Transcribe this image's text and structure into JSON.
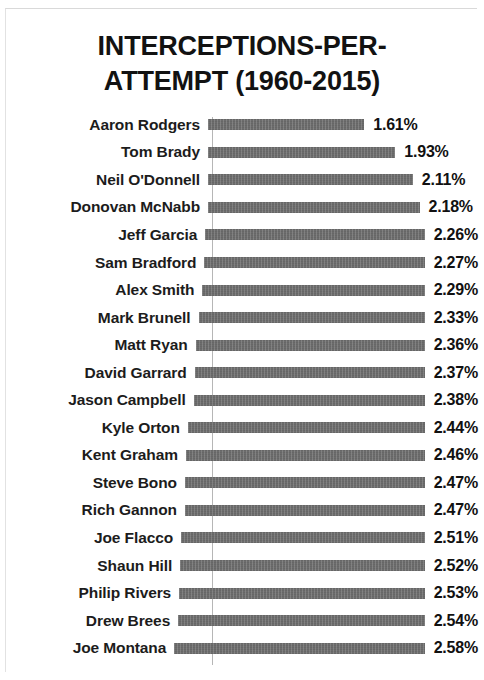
{
  "chart_data": {
    "type": "bar",
    "orientation": "horizontal",
    "title_lines": [
      "INTERCEPTIONS-PER-",
      "ATTEMPT (1960-2015)"
    ],
    "xlabel": "",
    "ylabel": "",
    "unit": "%",
    "grid": false,
    "legend": false,
    "xlim": [
      0,
      2.7
    ],
    "bar_color": "#6f6f6f",
    "axis_color": "#b6b6b6",
    "categories": [
      "Aaron Rodgers",
      "Tom Brady",
      "Neil O'Donnell",
      "Donovan McNabb",
      "Jeff Garcia",
      "Sam Bradford",
      "Alex Smith",
      "Mark Brunell",
      "Matt Ryan",
      "David Garrard",
      "Jason Campbell",
      "Kyle Orton",
      "Kent Graham",
      "Steve Bono",
      "Rich Gannon",
      "Joe Flacco",
      "Shaun Hill",
      "Philip Rivers",
      "Drew Brees",
      "Joe Montana"
    ],
    "values": [
      1.61,
      1.93,
      2.11,
      2.18,
      2.26,
      2.27,
      2.29,
      2.33,
      2.36,
      2.37,
      2.38,
      2.44,
      2.46,
      2.47,
      2.47,
      2.51,
      2.52,
      2.53,
      2.54,
      2.58
    ],
    "data_labels": [
      "1.61%",
      "1.93%",
      "2.11%",
      "2.18%",
      "2.26%",
      "2.27%",
      "2.29%",
      "2.33%",
      "2.36%",
      "2.37%",
      "2.38%",
      "2.44%",
      "2.46%",
      "2.47%",
      "2.47%",
      "2.51%",
      "2.52%",
      "2.53%",
      "2.54%",
      "2.58%"
    ]
  }
}
